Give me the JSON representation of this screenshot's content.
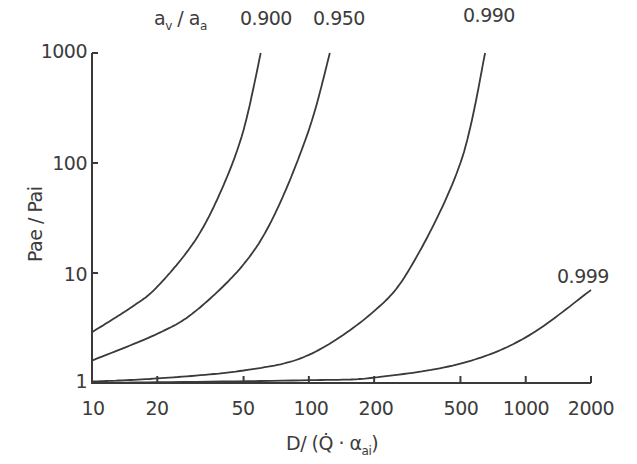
{
  "chart_data": {
    "type": "line",
    "title": "",
    "xlabel": "D/ (Q̇ · αai)",
    "ylabel": "Pae / Pai",
    "xscale": "log",
    "yscale": "log",
    "xlim": [
      10,
      2000
    ],
    "ylim": [
      1,
      1000
    ],
    "grid": false,
    "x_ticks": [
      10,
      20,
      50,
      100,
      200,
      500,
      1000,
      2000
    ],
    "y_ticks": [
      1,
      10,
      100,
      1000
    ],
    "legend_title": "av / aa",
    "series": [
      {
        "name": "0.900",
        "x": [
          10,
          15,
          20,
          30,
          40,
          50,
          60
        ],
        "y": [
          2.9,
          4.8,
          7.5,
          20,
          60,
          200,
          1000
        ]
      },
      {
        "name": "0.950",
        "x": [
          10,
          20,
          30,
          50,
          70,
          100,
          125
        ],
        "y": [
          1.6,
          2.8,
          4.5,
          12,
          35,
          200,
          1000
        ]
      },
      {
        "name": "0.990",
        "x": [
          10,
          20,
          50,
          100,
          200,
          300,
          500,
          650
        ],
        "y": [
          1.03,
          1.1,
          1.3,
          1.8,
          4.5,
          12,
          100,
          1000
        ]
      },
      {
        "name": "0.999",
        "x": [
          10,
          100,
          200,
          500,
          1000,
          2000
        ],
        "y": [
          1.0,
          1.06,
          1.12,
          1.5,
          2.6,
          7.0
        ]
      }
    ]
  },
  "labels": {
    "legend_title_main": "a",
    "legend_title_sub1": "v",
    "legend_title_mid": " / a",
    "legend_title_sub2": "a",
    "ylabel": "Pae / Pai",
    "xlabel_main": "D/ (Q̇ · α",
    "xlabel_sub": "ai",
    "xlabel_close": ")",
    "curve_labels": [
      "0.900",
      "0.950",
      "0.990",
      "0.999"
    ],
    "x_tick_labels": [
      "10",
      "20",
      "50",
      "100",
      "200",
      "500",
      "1000",
      "2000"
    ],
    "y_tick_labels": [
      "1",
      "10",
      "100",
      "1000"
    ]
  },
  "colors": {
    "line": "#3a3a3a",
    "text": "#3c3c3c",
    "background": "#ffffff"
  }
}
